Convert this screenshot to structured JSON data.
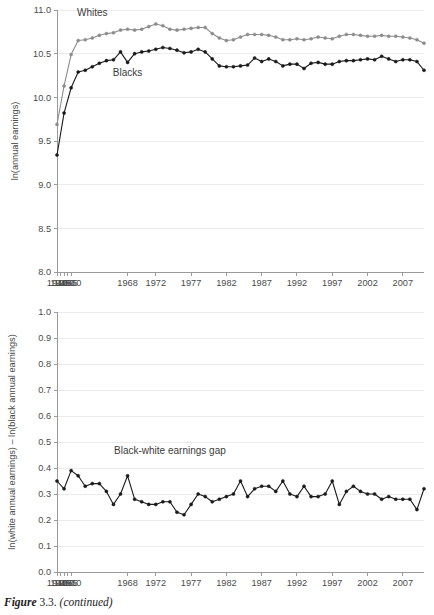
{
  "figure": {
    "caption_label": "Figure",
    "caption_number": "3.3.",
    "caption_note": "(continued)"
  },
  "colors": {
    "whites_series": "#8c8c8c",
    "blacks_series": "#1a1a1a",
    "gap_series": "#1a1a1a",
    "gridline": "#eceaea",
    "axis": "#9a9a9a",
    "text": "#4a4a4a",
    "background": "#ffffff"
  },
  "chart_data": [
    {
      "id": "earnings-levels",
      "type": "line",
      "title": "",
      "xlabel": "",
      "ylabel": "ln(annual earnings)",
      "ylim": [
        8.0,
        11.0
      ],
      "ytick_labels": [
        "8.0",
        "8.5",
        "9.0",
        "9.5",
        "10.0",
        "10.5",
        "11.0"
      ],
      "ytick_values": [
        8.0,
        8.5,
        9.0,
        9.5,
        10.0,
        10.5,
        11.0
      ],
      "xtick_labels": [
        "1940",
        "1945",
        "1950",
        "1955",
        "1960",
        "1968",
        "1972",
        "1977",
        "1982",
        "1987",
        "1992",
        "1997",
        "2002",
        "2007"
      ],
      "xtick_years": [
        1940,
        1945,
        1950,
        1955,
        1960,
        1968,
        1972,
        1977,
        1982,
        1987,
        1992,
        1997,
        2002,
        2007
      ],
      "grid": true,
      "legend_position": "inline-annotations",
      "annotations": [
        {
          "text": "Whites",
          "year": 1963,
          "value": 10.93
        },
        {
          "text": "Blacks",
          "year": 1968,
          "value": 10.24
        }
      ],
      "series": [
        {
          "name": "Whites",
          "color": "#8c8c8c",
          "marker": "circle",
          "x": [
            1940,
            1950,
            1960,
            1961,
            1962,
            1963,
            1964,
            1965,
            1966,
            1967,
            1968,
            1969,
            1970,
            1971,
            1972,
            1973,
            1974,
            1975,
            1976,
            1977,
            1978,
            1979,
            1980,
            1981,
            1982,
            1983,
            1984,
            1985,
            1986,
            1987,
            1988,
            1989,
            1990,
            1991,
            1992,
            1993,
            1994,
            1995,
            1996,
            1997,
            1998,
            1999,
            2000,
            2001,
            2002,
            2003,
            2004,
            2005,
            2006,
            2007,
            2008,
            2009,
            2010
          ],
          "values": [
            9.69,
            10.13,
            10.49,
            10.65,
            10.66,
            10.68,
            10.71,
            10.73,
            10.74,
            10.77,
            10.78,
            10.77,
            10.78,
            10.81,
            10.84,
            10.82,
            10.78,
            10.77,
            10.78,
            10.79,
            10.8,
            10.8,
            10.73,
            10.68,
            10.65,
            10.66,
            10.69,
            10.72,
            10.72,
            10.72,
            10.71,
            10.69,
            10.66,
            10.66,
            10.67,
            10.66,
            10.67,
            10.69,
            10.68,
            10.67,
            10.7,
            10.72,
            10.72,
            10.71,
            10.7,
            10.7,
            10.71,
            10.7,
            10.7,
            10.69,
            10.68,
            10.66,
            10.62
          ]
        },
        {
          "name": "Blacks",
          "color": "#1a1a1a",
          "marker": "circle",
          "x": [
            1940,
            1950,
            1960,
            1961,
            1962,
            1963,
            1964,
            1965,
            1966,
            1967,
            1968,
            1969,
            1970,
            1971,
            1972,
            1973,
            1974,
            1975,
            1976,
            1977,
            1978,
            1979,
            1980,
            1981,
            1982,
            1983,
            1984,
            1985,
            1986,
            1987,
            1988,
            1989,
            1990,
            1991,
            1992,
            1993,
            1994,
            1995,
            1996,
            1997,
            1998,
            1999,
            2000,
            2001,
            2002,
            2003,
            2004,
            2005,
            2006,
            2007,
            2008,
            2009,
            2010
          ],
          "values": [
            9.34,
            9.82,
            10.11,
            10.29,
            10.31,
            10.35,
            10.39,
            10.42,
            10.43,
            10.52,
            10.4,
            10.5,
            10.52,
            10.53,
            10.55,
            10.57,
            10.56,
            10.54,
            10.51,
            10.52,
            10.55,
            10.52,
            10.44,
            10.36,
            10.35,
            10.35,
            10.36,
            10.37,
            10.45,
            10.41,
            10.44,
            10.41,
            10.36,
            10.38,
            10.38,
            10.33,
            10.39,
            10.4,
            10.38,
            10.38,
            10.41,
            10.42,
            10.42,
            10.43,
            10.44,
            10.43,
            10.47,
            10.44,
            10.41,
            10.43,
            10.43,
            10.41,
            10.31
          ]
        }
      ]
    },
    {
      "id": "earnings-gap",
      "type": "line",
      "title": "",
      "xlabel": "",
      "ylabel": "ln(white annual earnings) – ln(black annual earnings)",
      "ylim": [
        0.0,
        1.0
      ],
      "ytick_labels": [
        "0.0",
        "0.1",
        "0.2",
        "0.3",
        "0.4",
        "0.5",
        "0.6",
        "0.7",
        "0.8",
        "0.9",
        "1.0"
      ],
      "ytick_values": [
        0.0,
        0.1,
        0.2,
        0.3,
        0.4,
        0.5,
        0.6,
        0.7,
        0.8,
        0.9,
        1.0
      ],
      "xtick_labels": [
        "1940",
        "1945",
        "1950",
        "1955",
        "1960",
        "1968",
        "1972",
        "1977",
        "1982",
        "1987",
        "1992",
        "1997",
        "2002",
        "2007"
      ],
      "xtick_years": [
        1940,
        1945,
        1950,
        1955,
        1960,
        1968,
        1972,
        1977,
        1982,
        1987,
        1992,
        1997,
        2002,
        2007
      ],
      "grid": true,
      "legend_position": "inline-annotation",
      "annotations": [
        {
          "text": "Black-white earnings gap",
          "year": 1974,
          "value": 0.455
        }
      ],
      "series": [
        {
          "name": "Black-white earnings gap",
          "color": "#1a1a1a",
          "marker": "circle",
          "x": [
            1940,
            1950,
            1960,
            1961,
            1962,
            1963,
            1964,
            1965,
            1966,
            1967,
            1968,
            1969,
            1970,
            1971,
            1972,
            1973,
            1974,
            1975,
            1976,
            1977,
            1978,
            1979,
            1980,
            1981,
            1982,
            1983,
            1984,
            1985,
            1986,
            1987,
            1988,
            1989,
            1990,
            1991,
            1992,
            1993,
            1994,
            1995,
            1996,
            1997,
            1998,
            1999,
            2000,
            2001,
            2002,
            2003,
            2004,
            2005,
            2006,
            2007,
            2008,
            2009,
            2010
          ],
          "values": [
            0.35,
            0.32,
            0.39,
            0.37,
            0.33,
            0.34,
            0.34,
            0.31,
            0.26,
            0.3,
            0.37,
            0.28,
            0.27,
            0.26,
            0.26,
            0.27,
            0.27,
            0.23,
            0.22,
            0.26,
            0.3,
            0.29,
            0.27,
            0.28,
            0.29,
            0.3,
            0.35,
            0.29,
            0.32,
            0.33,
            0.33,
            0.31,
            0.35,
            0.3,
            0.29,
            0.33,
            0.29,
            0.29,
            0.3,
            0.35,
            0.26,
            0.31,
            0.33,
            0.31,
            0.3,
            0.3,
            0.28,
            0.29,
            0.28,
            0.28,
            0.28,
            0.24,
            0.32
          ]
        }
      ]
    }
  ]
}
